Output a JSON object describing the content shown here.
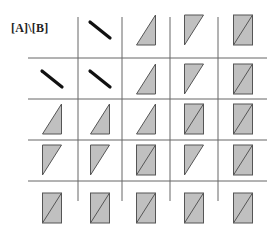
{
  "diagram": {
    "corner_label": "[A]\\[B]",
    "colors": {
      "fill": "#c0c0c0",
      "stroke": "#555555",
      "grid": "#666666",
      "slash": "#111111"
    },
    "grid": {
      "rows": [
        [
          "label",
          "slash",
          "tri-up",
          "tri-down",
          "rect"
        ],
        [
          "slash",
          "slash",
          "tri-up",
          "tri-down",
          "rect"
        ],
        [
          "tri-up",
          "tri-up",
          "tri-up",
          "rect",
          "rect"
        ],
        [
          "tri-down",
          "tri-down",
          "rect",
          "tri-down",
          "rect"
        ],
        [
          "rect",
          "rect",
          "rect",
          "rect",
          "rect"
        ]
      ],
      "col_centers": [
        52,
        100,
        146,
        194,
        243
      ],
      "row_centers": [
        30,
        79,
        119,
        160,
        208
      ]
    }
  }
}
